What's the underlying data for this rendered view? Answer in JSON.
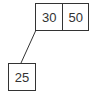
{
  "diagram": {
    "type": "b-tree",
    "nodes": {
      "root": {
        "keys": [
          "30",
          "50"
        ]
      },
      "child_left": {
        "keys": [
          "25"
        ]
      }
    },
    "edges": [
      {
        "from": "root",
        "to": "child_left",
        "pointer": "left"
      }
    ],
    "colors": {
      "stroke": "#333333",
      "fill": "#ffffff",
      "text": "#333333"
    }
  }
}
